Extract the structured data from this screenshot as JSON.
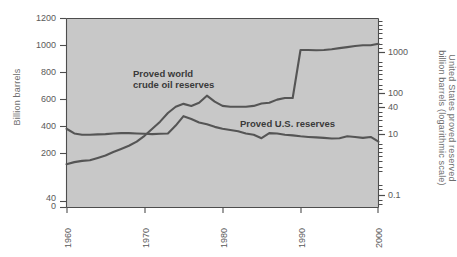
{
  "figure": {
    "name": "proved-oil-reserves-chart",
    "background_color": "#ffffff",
    "plot_background_color": "#c8c8c8",
    "line_color": "#555555",
    "axis_color": "#4d4d4d",
    "tick_text_color": "#5a5a5a",
    "axis_title_color": "#6e6e6e"
  },
  "chart_data": {
    "type": "line",
    "title": "",
    "subtitle": "",
    "xlabel": "",
    "ylabel": "Billion barrels",
    "y2label": "United States proved reserved billion barrels (logarithmic scale)",
    "grid": false,
    "legend_position": "inline-annotations",
    "xlim": [
      1960,
      2000
    ],
    "xticks": [
      1960,
      1970,
      1980,
      1990,
      2000
    ],
    "xtick_labels": [
      "1960",
      "1970",
      "1980",
      "1990",
      "2000"
    ],
    "ylim": [
      0,
      1200
    ],
    "yticks": [
      0,
      40,
      200,
      400,
      600,
      800,
      1000,
      1200
    ],
    "ytick_labels": [
      "0",
      "40",
      "200",
      "400",
      "600",
      "800",
      "1000",
      "1200"
    ],
    "y2_scale": "log",
    "y2lim": [
      0.1,
      3000
    ],
    "y2ticks": [
      0.1,
      10,
      40,
      100,
      1000
    ],
    "y2tick_labels": [
      "0.1",
      "10",
      "40",
      "100",
      "1000"
    ],
    "annotations": [
      {
        "name": "world-reserves-annotation",
        "lines": [
          "Proved world",
          "crude oil reserves"
        ],
        "x_px": 133,
        "y_px": 68
      },
      {
        "name": "us-reserves-annotation",
        "lines": [
          "Proved U.S. reserves"
        ],
        "x_px": 240,
        "y_px": 118
      }
    ],
    "series": [
      {
        "name": "Proved world crude oil reserves",
        "axis": "left",
        "units": "billion barrels",
        "x": [
          1960,
          1961,
          1962,
          1963,
          1964,
          1965,
          1966,
          1967,
          1968,
          1969,
          1970,
          1971,
          1972,
          1973,
          1974,
          1975,
          1976,
          1977,
          1978,
          1979,
          1980,
          1981,
          1982,
          1983,
          1984,
          1985,
          1986,
          1987,
          1988,
          1989,
          1990,
          1991,
          1992,
          1993,
          1994,
          1995,
          1996,
          1997,
          1998,
          1999,
          2000
        ],
        "values": [
          275,
          288,
          296,
          300,
          315,
          330,
          352,
          372,
          392,
          418,
          455,
          500,
          545,
          600,
          640,
          658,
          645,
          665,
          710,
          672,
          645,
          640,
          640,
          640,
          645,
          660,
          665,
          685,
          695,
          695,
          1000,
          1000,
          998,
          1000,
          1005,
          1012,
          1018,
          1025,
          1030,
          1030,
          1040
        ]
      },
      {
        "name": "Proved U.S. reserves",
        "axis": "right",
        "units": "billion barrels (log scale)",
        "x": [
          1960,
          1961,
          1962,
          1963,
          1964,
          1965,
          1966,
          1967,
          1968,
          1969,
          1970,
          1971,
          1972,
          1973,
          1974,
          1975,
          1976,
          1977,
          1978,
          1979,
          1980,
          1981,
          1982,
          1983,
          1984,
          1985,
          1986,
          1987,
          1988,
          1989,
          1990,
          1991,
          1992,
          1993,
          1994,
          1995,
          1996,
          1997,
          1998,
          1999,
          2000
        ],
        "values_left_equivalent": [
          500,
          470,
          462,
          462,
          464,
          466,
          470,
          472,
          472,
          470,
          468,
          466,
          468,
          470,
          520,
          580,
          562,
          540,
          528,
          512,
          500,
          492,
          484,
          470,
          462,
          440,
          472,
          470,
          462,
          458,
          452,
          448,
          445,
          442,
          438,
          440,
          452,
          448,
          442,
          448,
          418
        ]
      }
    ]
  },
  "axes": {
    "left_ticks": [
      {
        "label": "1200",
        "y_px": 18
      },
      {
        "label": "1000",
        "y_px": 46
      },
      {
        "label": "800",
        "y_px": 73
      },
      {
        "label": "600",
        "y_px": 100
      },
      {
        "label": "400",
        "y_px": 127
      },
      {
        "label": "200",
        "y_px": 154
      },
      {
        "label": "40",
        "y_px": 197
      },
      {
        "label": "0",
        "y_px": 206
      }
    ],
    "right_ticks": [
      {
        "label": "1000",
        "y_px": 52
      },
      {
        "label": "100",
        "y_px": 93
      },
      {
        "label": "40",
        "y_px": 107
      },
      {
        "label": "10",
        "y_px": 134
      },
      {
        "label": "0.1",
        "y_px": 195
      }
    ],
    "bottom_ticks": [
      {
        "label": "1960",
        "x_px": 67
      },
      {
        "label": "1970",
        "x_px": 145
      },
      {
        "label": "1980",
        "x_px": 223
      },
      {
        "label": "1990",
        "x_px": 301
      },
      {
        "label": "2000",
        "x_px": 378
      }
    ]
  }
}
